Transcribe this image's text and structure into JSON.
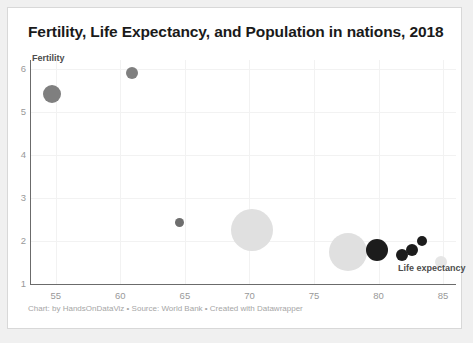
{
  "chart_data": {
    "type": "scatter",
    "title": "Fertility, Life Expectancy, and Population in nations, 2018",
    "xlabel": "Life expectancy",
    "ylabel": "Fertility",
    "xlim": [
      53,
      86
    ],
    "ylim": [
      1,
      6.2
    ],
    "xticks": [
      "55",
      "60",
      "65",
      "70",
      "75",
      "80",
      "85"
    ],
    "xtick_values": [
      55,
      60,
      65,
      70,
      75,
      80,
      85
    ],
    "yticks": [
      "1",
      "2",
      "3",
      "4",
      "5",
      "6"
    ],
    "ytick_values": [
      1,
      2,
      3,
      4,
      5,
      6
    ],
    "grid": true,
    "legend": "none",
    "size_encodes": "population",
    "points": [
      {
        "x": 54.7,
        "y": 5.4,
        "r": 9.0,
        "color": "#7f7f7f"
      },
      {
        "x": 60.9,
        "y": 5.9,
        "r": 6.0,
        "color": "#7f7f7f"
      },
      {
        "x": 64.6,
        "y": 2.43,
        "r": 4.5,
        "color": "#6e6e6e"
      },
      {
        "x": 70.2,
        "y": 2.25,
        "r": 21.0,
        "color": "#e0e0e0"
      },
      {
        "x": 77.6,
        "y": 1.75,
        "r": 19.0,
        "color": "#e0e0e0"
      },
      {
        "x": 79.9,
        "y": 1.78,
        "r": 11.0,
        "color": "#1c1c1c"
      },
      {
        "x": 81.8,
        "y": 1.68,
        "r": 6.0,
        "color": "#1c1c1c"
      },
      {
        "x": 82.6,
        "y": 1.8,
        "r": 6.0,
        "color": "#1c1c1c"
      },
      {
        "x": 83.4,
        "y": 2.0,
        "r": 5.0,
        "color": "#1c1c1c"
      },
      {
        "x": 84.8,
        "y": 1.5,
        "r": 6.0,
        "color": "#e6e6e6"
      }
    ]
  },
  "footer": {
    "text": "Chart: by HandsOnDataViz • Source: World Bank • Created with Datawrapper"
  },
  "colors": {
    "background": "#f0f0f0",
    "card": "#ffffff",
    "axis": "#6b6b6b",
    "grid": "#f2f2f2",
    "tick_text": "#999999",
    "title_text": "#1a1a1a",
    "footer_text": "#a6a6a6"
  }
}
